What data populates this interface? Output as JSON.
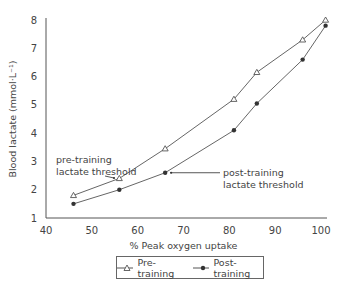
{
  "chart_data": {
    "type": "line",
    "title": "",
    "xlabel": "% Peak oxygen uptake",
    "ylabel": "Blood lactate (mmol·L⁻¹)",
    "xlim": [
      40,
      100
    ],
    "ylim": [
      1,
      8
    ],
    "xticks": [
      40,
      50,
      60,
      70,
      80,
      90,
      100
    ],
    "yticks": [
      1,
      2,
      3,
      4,
      5,
      6,
      7,
      8
    ],
    "grid": false,
    "legend_position": "bottom",
    "series": [
      {
        "name": "Pre-training",
        "marker": "open-triangle",
        "x": [
          46,
          56,
          66,
          81,
          86,
          96,
          101
        ],
        "y": [
          1.8,
          2.4,
          3.45,
          5.2,
          6.15,
          7.3,
          8.0
        ]
      },
      {
        "name": "Post-training",
        "marker": "filled-circle",
        "x": [
          46,
          56,
          66,
          81,
          86,
          96,
          101
        ],
        "y": [
          1.5,
          2.0,
          2.6,
          4.1,
          5.05,
          6.6,
          7.8
        ]
      }
    ],
    "annotations": [
      {
        "text": [
          "pre-training",
          "lactate threshold"
        ],
        "points_to": {
          "series": "Pre-training",
          "x": 56,
          "y": 2.4
        }
      },
      {
        "text": [
          "post-training",
          "lactate threshold"
        ],
        "points_to": {
          "series": "Post-training",
          "x": 66,
          "y": 2.6
        }
      }
    ]
  },
  "legend": {
    "pre_label": "Pre-training",
    "post_label": "Post-training"
  }
}
